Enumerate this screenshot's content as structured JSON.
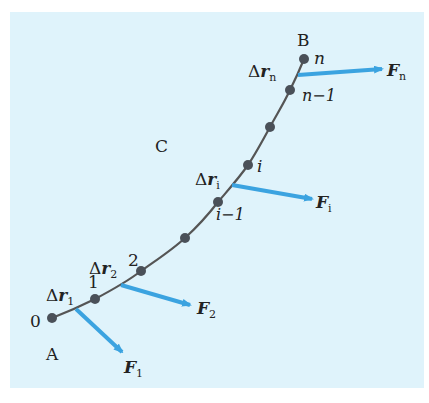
{
  "colors": {
    "panel_bg": "#dff3fb",
    "curve": "#555555",
    "point": "#4a5058",
    "arrow": "#3ba3e0",
    "text": "#222222"
  },
  "labels": {
    "A": "A",
    "B": "B",
    "C": "C",
    "p0": "0",
    "p1": "1",
    "p2": "2",
    "pi": "i",
    "pim1": "i−1",
    "pn": "n",
    "pnm1": "n−1",
    "dr1_delta": "Δ",
    "dr1_r": "r",
    "dr1_sub": "1",
    "dr2_delta": "Δ",
    "dr2_r": "r",
    "dr2_sub": "2",
    "dri_delta": "Δ",
    "dri_r": "r",
    "dri_sub": "i",
    "drn_delta": "Δ",
    "drn_r": "r",
    "drn_sub": "n",
    "F1_F": "F",
    "F1_sub": "1",
    "F2_F": "F",
    "F2_sub": "2",
    "Fi_F": "F",
    "Fi_sub": "i",
    "Fn_F": "F",
    "Fn_sub": "n"
  },
  "points": [
    {
      "name": "0",
      "x": 52,
      "y": 318
    },
    {
      "name": "1",
      "x": 95,
      "y": 299
    },
    {
      "name": "2",
      "x": 141,
      "y": 271
    },
    {
      "name": "mid-a",
      "x": 185,
      "y": 238
    },
    {
      "name": "i-1",
      "x": 218,
      "y": 202
    },
    {
      "name": "i",
      "x": 248,
      "y": 165
    },
    {
      "name": "mid-b",
      "x": 270,
      "y": 127
    },
    {
      "name": "n-1",
      "x": 290,
      "y": 90
    },
    {
      "name": "n",
      "x": 304,
      "y": 59
    }
  ],
  "forces": [
    {
      "name": "F1",
      "x1": 76,
      "y1": 309,
      "x2": 122,
      "y2": 352
    },
    {
      "name": "F2",
      "x1": 121,
      "y1": 285,
      "x2": 190,
      "y2": 305
    },
    {
      "name": "Fi",
      "x1": 232,
      "y1": 185,
      "x2": 312,
      "y2": 199
    },
    {
      "name": "Fn",
      "x1": 298,
      "y1": 75,
      "x2": 382,
      "y2": 69
    }
  ]
}
